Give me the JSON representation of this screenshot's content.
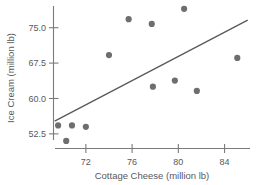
{
  "chart_data": {
    "type": "scatter",
    "title": "",
    "xlabel": "Cottage Cheese (million lb)",
    "ylabel": "Ice Cream (million lb)",
    "xticks": [
      72,
      76,
      80,
      84
    ],
    "yticks": [
      52.5,
      60.0,
      67.5,
      75.0
    ],
    "xticklabels": [
      "72",
      "76",
      "80",
      "84"
    ],
    "yticklabels": [
      "52.5",
      "60.0",
      "67.5",
      "75.0"
    ],
    "xlim": [
      69.2,
      86.2
    ],
    "ylim": [
      49.4,
      79.6
    ],
    "grid": false,
    "legend": null,
    "marker_color": "#6d6e70",
    "line_color": "#58595b",
    "axis_color": "#7a7b7d",
    "points": [
      {
        "x": 69.6,
        "y": 54.3
      },
      {
        "x": 70.8,
        "y": 54.3
      },
      {
        "x": 70.3,
        "y": 51.0
      },
      {
        "x": 72.0,
        "y": 54.0
      },
      {
        "x": 74.0,
        "y": 69.2
      },
      {
        "x": 75.7,
        "y": 76.8
      },
      {
        "x": 77.7,
        "y": 75.8
      },
      {
        "x": 77.8,
        "y": 62.5
      },
      {
        "x": 79.7,
        "y": 63.8
      },
      {
        "x": 80.5,
        "y": 79.0
      },
      {
        "x": 81.6,
        "y": 61.6
      },
      {
        "x": 85.1,
        "y": 68.6
      }
    ],
    "fit_line": {
      "x1": 69.3,
      "y1": 55.2,
      "x2": 86.0,
      "y2": 76.6
    }
  }
}
